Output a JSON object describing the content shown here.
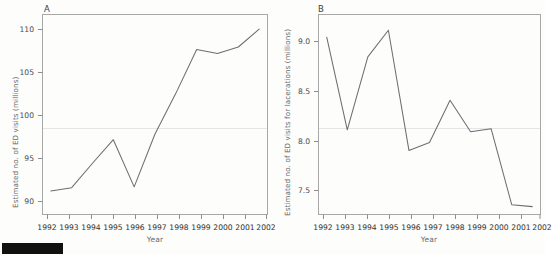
{
  "figure": {
    "background_color": "#fdfdfc",
    "line_color": "#6e6e6e",
    "axis_color": "#9a9a9a",
    "text_color": "#4a4a4a",
    "redaction_bar_color": "#111111"
  },
  "panel_a": {
    "letter": "A",
    "xlabel": "Year",
    "ylabel": "Estimated no. of ED visits (millions)",
    "ytick_labels": [
      "110",
      "105",
      "100",
      "95",
      "90"
    ],
    "xtick_labels": [
      "1992",
      "1993",
      "1994",
      "1995",
      "1996",
      "1997",
      "1998",
      "1999",
      "2000",
      "2001",
      "2002"
    ]
  },
  "panel_b": {
    "letter": "B",
    "xlabel": "Year",
    "ylabel": "Estimated no. of ED visits for lacerations (millions)",
    "ytick_labels": [
      "9.0",
      "8.5",
      "8.0",
      "7.5"
    ],
    "xtick_labels": [
      "1992",
      "1993",
      "1994",
      "1995",
      "1996",
      "1997",
      "1998",
      "1999",
      "2000",
      "2001",
      "2002"
    ]
  },
  "chart_data": [
    {
      "type": "line",
      "id": "panel-a",
      "title": "A",
      "xlabel": "Year",
      "ylabel": "Estimated no. of ED visits (millions)",
      "x": [
        1992,
        1993,
        1994,
        1995,
        1996,
        1997,
        1998,
        1999,
        2000,
        2001,
        2002
      ],
      "values": [
        89.9,
        90.3,
        93.3,
        96.2,
        90.4,
        96.9,
        101.9,
        107.3,
        106.8,
        107.6,
        109.8
      ],
      "series": [
        {
          "name": "Estimated no. of ED visits (millions)",
          "values": [
            89.9,
            90.3,
            93.3,
            96.2,
            90.4,
            96.9,
            101.9,
            107.3,
            106.8,
            107.6,
            109.8
          ]
        }
      ],
      "xlim": [
        1991.6,
        2002.4
      ],
      "ylim": [
        87.0,
        111.6
      ],
      "yticks": [
        90,
        95,
        100,
        105,
        110
      ],
      "xticks": [
        1992,
        1993,
        1994,
        1995,
        1996,
        1997,
        1998,
        1999,
        2000,
        2001,
        2002
      ],
      "grid": false,
      "legend": "none",
      "markers": false
    },
    {
      "type": "line",
      "id": "panel-b",
      "title": "B",
      "xlabel": "Year",
      "ylabel": "Estimated no. of ED visits for lacerations (millions)",
      "x": [
        1992,
        1993,
        1994,
        1995,
        1996,
        1997,
        1998,
        1999,
        2000,
        2001,
        2002
      ],
      "values": [
        9.02,
        8.08,
        8.82,
        9.09,
        7.87,
        7.95,
        8.38,
        8.06,
        8.09,
        7.32,
        7.3
      ],
      "series": [
        {
          "name": "Estimated no. of ED visits for lacerations (millions)",
          "values": [
            9.02,
            8.08,
            8.82,
            9.09,
            7.87,
            7.95,
            8.38,
            8.06,
            8.09,
            7.32,
            7.3
          ]
        }
      ],
      "xlim": [
        1991.6,
        2002.4
      ],
      "ylim": [
        7.22,
        9.25
      ],
      "yticks": [
        7.5,
        8.0,
        8.5,
        9.0
      ],
      "xticks": [
        1992,
        1993,
        1994,
        1995,
        1996,
        1997,
        1998,
        1999,
        2000,
        2001,
        2002
      ],
      "grid": false,
      "legend": "none",
      "markers": false
    }
  ]
}
